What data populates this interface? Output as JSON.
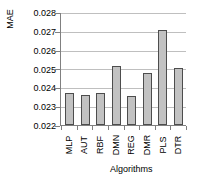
{
  "chart_data": {
    "type": "bar",
    "title": "",
    "subtitle": "",
    "xlabel": "Algorithms",
    "ylabel": "MAE",
    "categories": [
      "MLP",
      "AUT",
      "RBF",
      "DMN",
      "REG",
      "DMR",
      "PLS",
      "DTR"
    ],
    "values": [
      0.0237,
      0.0236,
      0.0237,
      0.02513,
      0.02355,
      0.02475,
      0.02705,
      0.02505
    ],
    "ylim": [
      0.022,
      0.028
    ],
    "ytick_values": [
      0.022,
      0.023,
      0.024,
      0.025,
      0.026,
      0.027,
      0.028
    ],
    "ytick_labels": [
      "0.022",
      "0.023",
      "0.024",
      "0.025",
      "0.026",
      "0.027",
      "0.028"
    ],
    "grid": true,
    "grid_axis": "y",
    "legend": false,
    "legend_position": "none",
    "series": [
      {
        "name": "MAE",
        "values": [
          0.0237,
          0.0236,
          0.0237,
          0.02513,
          0.02355,
          0.02475,
          0.02705,
          0.02505
        ]
      }
    ],
    "bar_fill_color": "#c2c2c2",
    "bar_border_color": "#4d4d4d",
    "grid_color": "#bfbfbf",
    "axis_color": "#808080",
    "background_color": "#ffffff",
    "xtick_label_rotation": 90
  }
}
